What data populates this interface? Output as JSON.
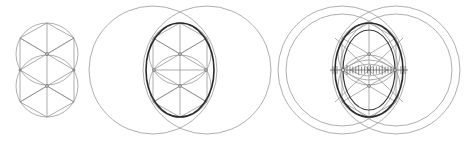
{
  "diagram": {
    "colors": {
      "background": "#ffffff",
      "construction_line": "#9a9a9a",
      "oval_stroke": "#2a2a2a"
    },
    "figures": [
      {
        "id": "stage-1",
        "description": "Two stacked circles with inscribed hexagon grid",
        "circles": [
          {
            "cx": 47,
            "cy": 54,
            "r": 31
          },
          {
            "cx": 47,
            "cy": 86,
            "r": 31
          }
        ]
      },
      {
        "id": "stage-2",
        "description": "Two large side circles, hexagon grid and bold oval",
        "large_circles": [
          {
            "cx": 153,
            "cy": 70,
            "r": 64
          },
          {
            "cx": 207,
            "cy": 70,
            "r": 64
          }
        ],
        "oval": {
          "cx": 180,
          "cy": 70,
          "rx": 34,
          "ry": 47
        }
      },
      {
        "id": "stage-3",
        "description": "Double large circles, two nested ovals and tick-marked axis",
        "large_circles": [
          {
            "cx": 342,
            "cy": 70,
            "r": 64
          },
          {
            "cx": 342,
            "cy": 70,
            "r": 56
          },
          {
            "cx": 396,
            "cy": 70,
            "r": 64
          },
          {
            "cx": 396,
            "cy": 70,
            "r": 56
          }
        ],
        "ovals": [
          {
            "cx": 369,
            "cy": 70,
            "rx": 34,
            "ry": 47
          },
          {
            "cx": 369,
            "cy": 70,
            "rx": 26,
            "ry": 40
          }
        ],
        "axis_ticks": 16
      }
    ]
  }
}
